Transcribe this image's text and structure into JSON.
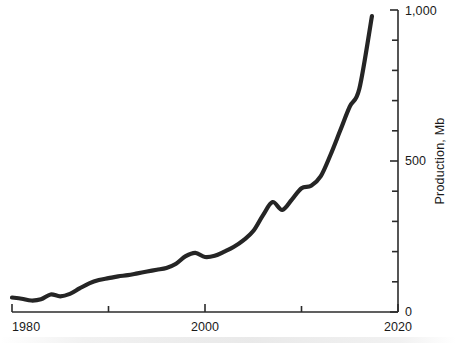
{
  "chart_data": {
    "type": "line",
    "title": "",
    "xlabel": "",
    "ylabel": "Production, Mb",
    "xlim": [
      1980,
      2020
    ],
    "ylim": [
      0,
      1000
    ],
    "x_ticks_major": [
      1980,
      2000,
      2020
    ],
    "x_tick_labels": [
      "1980",
      "2000",
      "2020"
    ],
    "x_ticks_minor": [
      1990,
      2010
    ],
    "y_ticks_major": [
      0,
      500,
      1000
    ],
    "y_tick_labels": [
      "0",
      "500",
      "1,000"
    ],
    "y_ticks_minor": [
      100,
      200,
      300,
      400,
      600,
      700,
      800,
      900
    ],
    "y_axis_position": "right",
    "grid": false,
    "legend": null,
    "line_color": "#252525",
    "series": [
      {
        "name": "Production",
        "x": [
          1980,
          1981,
          1982,
          1983,
          1984,
          1985,
          1986,
          1987,
          1988,
          1989,
          1990,
          1991,
          1992,
          1993,
          1994,
          1995,
          1996,
          1997,
          1998,
          1999,
          2000,
          2001,
          2002,
          2003,
          2004,
          2005,
          2006,
          2007,
          2008,
          2009,
          2010,
          2011,
          2012,
          2013,
          2014,
          2015,
          2016,
          2017.3
        ],
        "values": [
          48,
          44,
          38,
          42,
          58,
          52,
          60,
          78,
          95,
          106,
          112,
          118,
          122,
          128,
          134,
          140,
          146,
          160,
          185,
          196,
          182,
          186,
          200,
          216,
          238,
          268,
          320,
          364,
          338,
          372,
          410,
          418,
          450,
          520,
          600,
          680,
          740,
          980
        ]
      }
    ]
  },
  "axis_labels": {
    "x_left": "1980",
    "x_mid": "2000",
    "x_right": "2020",
    "y_zero": "0",
    "y_mid": "500",
    "y_top": "1,000",
    "y_title": "Production, Mb"
  }
}
